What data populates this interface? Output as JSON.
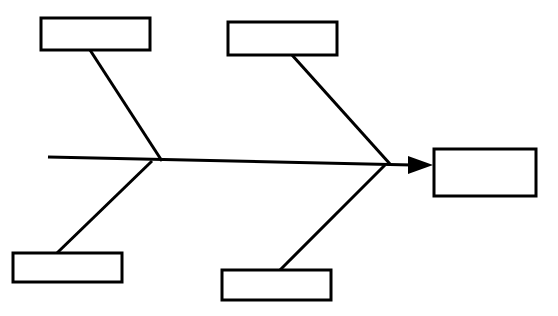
{
  "diagram": {
    "type": "fishbone-ishikawa",
    "title": "",
    "background_color": "#ffffff",
    "line_color": "#000000",
    "fill_color": "#ffffff",
    "stroke_width": 3,
    "effect": {
      "name": "effect-box",
      "label": "",
      "x": 434,
      "y": 149,
      "width": 102,
      "height": 47
    },
    "spine": {
      "name": "spine-line",
      "x1": 48,
      "y1": 157,
      "x2": 412,
      "y2": 165,
      "arrow": {
        "name": "arrowhead",
        "tip_x": 433,
        "tip_y": 165,
        "back_x": 408,
        "half_height": 9
      }
    },
    "categories": [
      {
        "name": "category-box-top-left",
        "label": "",
        "position": "top",
        "x": 41,
        "y": 18,
        "width": 109,
        "height": 32,
        "rib": {
          "x1": 90,
          "y1": 50,
          "x2": 162,
          "y2": 161
        }
      },
      {
        "name": "category-box-top-right",
        "label": "",
        "position": "top",
        "x": 228,
        "y": 22,
        "width": 109,
        "height": 33,
        "rib": {
          "x1": 292,
          "y1": 55,
          "x2": 390,
          "y2": 164
        }
      },
      {
        "name": "category-box-bottom-left",
        "label": "",
        "position": "bottom",
        "x": 13,
        "y": 253,
        "width": 109,
        "height": 29,
        "rib": {
          "x1": 57,
          "y1": 253,
          "x2": 152,
          "y2": 161
        }
      },
      {
        "name": "category-box-bottom-right",
        "label": "",
        "position": "bottom",
        "x": 222,
        "y": 270,
        "width": 109,
        "height": 30,
        "rib": {
          "x1": 280,
          "y1": 270,
          "x2": 385,
          "y2": 165
        }
      }
    ]
  }
}
